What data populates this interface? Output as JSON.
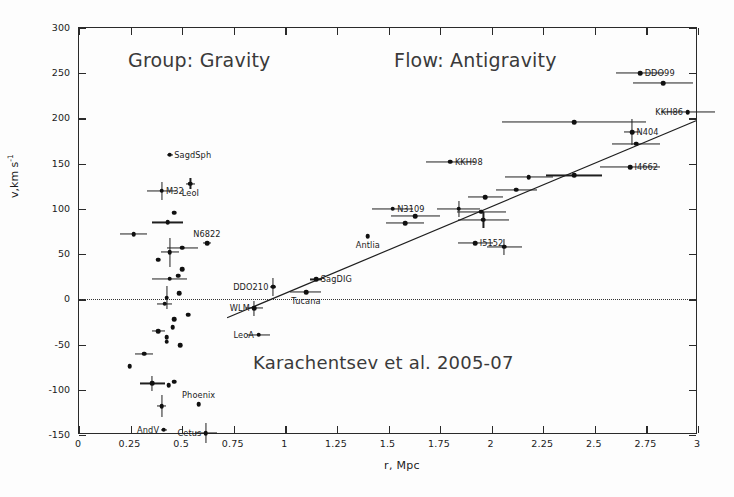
{
  "figure": {
    "background": "#fdfdfd",
    "ink_color": "#1b1b1b",
    "annotations": {
      "left_note": "Group: Gravity",
      "right_note": "Flow: Antigravity",
      "credit": "Karachentsev et al. 2005-07"
    }
  },
  "chart_data": {
    "type": "scatter",
    "title": "",
    "xlabel": "r, Mpc",
    "ylabel": "v,km s-1",
    "ylabel_parts": {
      "base": "v,km s",
      "exponent": "-1"
    },
    "xlim": [
      0,
      3
    ],
    "ylim": [
      -150,
      300
    ],
    "xticks": [
      0,
      0.25,
      0.5,
      0.75,
      1,
      1.25,
      1.5,
      1.75,
      2,
      2.25,
      2.5,
      2.75,
      3
    ],
    "xticklabels": [
      "0",
      "0.25",
      "0.5",
      "0.75",
      "1",
      "1.25",
      "1.5",
      "1.75",
      "2",
      "2.25",
      "2.5",
      "2.75",
      "3"
    ],
    "yticks": [
      -150,
      -100,
      -50,
      0,
      50,
      100,
      150,
      200,
      250,
      300
    ],
    "yticklabels": [
      "-150",
      "-100",
      "-50",
      "0",
      "50",
      "100",
      "150",
      "200",
      "250",
      "300"
    ],
    "grid": false,
    "legend": null,
    "zero_line": {
      "y": 0,
      "style": "dotted"
    },
    "fit_line": {
      "label": "",
      "x_start": 0.72,
      "y_start": -22,
      "x_end": 3.0,
      "y_end": 197
    },
    "points": [
      {
        "label": "SagdSph",
        "x": 0.44,
        "y": 160,
        "xerr": 0.015,
        "yerr": 0,
        "label_side": "right"
      },
      {
        "label": "M32",
        "x": 0.4,
        "y": 120,
        "xerr": 0.07,
        "yerr": 10,
        "label_side": "right"
      },
      {
        "label": "LeoI",
        "x": 0.54,
        "y": 128,
        "xerr": 0.02,
        "yerr": 6,
        "label_side": "below"
      },
      {
        "label": "",
        "x": 0.46,
        "y": 96,
        "xerr": 0,
        "yerr": 0,
        "label_side": "right"
      },
      {
        "label": "",
        "x": 0.43,
        "y": 85,
        "xerr": 0.075,
        "yerr": 0,
        "label_side": "right"
      },
      {
        "label": "",
        "x": 0.265,
        "y": 72,
        "xerr": 0.065,
        "yerr": 0,
        "label_side": "right"
      },
      {
        "label": "N6822",
        "x": 0.62,
        "y": 62,
        "xerr": 0.02,
        "yerr": 0,
        "label_side": "above"
      },
      {
        "label": "",
        "x": 0.44,
        "y": 52,
        "xerr": 0.045,
        "yerr": 16,
        "label_side": "right"
      },
      {
        "label": "",
        "x": 0.5,
        "y": 57,
        "xerr": 0.075,
        "yerr": 0,
        "label_side": "right"
      },
      {
        "label": "",
        "x": 0.385,
        "y": 44,
        "xerr": 0,
        "yerr": 0,
        "label_side": "right"
      },
      {
        "label": "",
        "x": 0.5,
        "y": 33,
        "xerr": 0,
        "yerr": 0,
        "label_side": "right"
      },
      {
        "label": "",
        "x": 0.48,
        "y": 26,
        "xerr": 0,
        "yerr": 0,
        "label_side": "right"
      },
      {
        "label": "",
        "x": 0.44,
        "y": 23,
        "xerr": 0.085,
        "yerr": 0,
        "label_side": "right"
      },
      {
        "label": "",
        "x": 0.485,
        "y": 7,
        "xerr": 0,
        "yerr": 0,
        "label_side": "right"
      },
      {
        "label": "",
        "x": 0.425,
        "y": 2,
        "xerr": 0,
        "yerr": 13,
        "label_side": "right"
      },
      {
        "label": "",
        "x": 0.415,
        "y": -5,
        "xerr": 0.035,
        "yerr": 0,
        "label_side": "right"
      },
      {
        "label": "",
        "x": 0.53,
        "y": -17,
        "xerr": 0,
        "yerr": 0,
        "label_side": "right"
      },
      {
        "label": "",
        "x": 0.46,
        "y": -22,
        "xerr": 0,
        "yerr": 0,
        "label_side": "right"
      },
      {
        "label": "",
        "x": 0.455,
        "y": -31,
        "xerr": 0,
        "yerr": 0,
        "label_side": "right"
      },
      {
        "label": "",
        "x": 0.385,
        "y": -35,
        "xerr": 0.03,
        "yerr": 0,
        "label_side": "right"
      },
      {
        "label": "",
        "x": 0.425,
        "y": -42,
        "xerr": 0,
        "yerr": 0,
        "label_side": "right"
      },
      {
        "label": "",
        "x": 0.425,
        "y": -47,
        "xerr": 0,
        "yerr": 0,
        "label_side": "right"
      },
      {
        "label": "",
        "x": 0.49,
        "y": -51,
        "xerr": 0,
        "yerr": 0,
        "label_side": "right"
      },
      {
        "label": "",
        "x": 0.315,
        "y": -60,
        "xerr": 0.045,
        "yerr": 0,
        "label_side": "right"
      },
      {
        "label": "",
        "x": 0.245,
        "y": -74,
        "xerr": 0,
        "yerr": 0,
        "label_side": "right"
      },
      {
        "label": "",
        "x": 0.355,
        "y": -93,
        "xerr": 0.06,
        "yerr": 8,
        "label_side": "right"
      },
      {
        "label": "",
        "x": 0.46,
        "y": -91,
        "xerr": 0,
        "yerr": 0,
        "label_side": "right"
      },
      {
        "label": "",
        "x": 0.435,
        "y": -95,
        "xerr": 0,
        "yerr": 0,
        "label_side": "right"
      },
      {
        "label": "Phoenix",
        "x": 0.58,
        "y": -116,
        "xerr": 0,
        "yerr": 0,
        "label_side": "above"
      },
      {
        "label": "",
        "x": 0.4,
        "y": -118,
        "xerr": 0.02,
        "yerr": 12,
        "label_side": "right"
      },
      {
        "label": "AndV",
        "x": 0.41,
        "y": -144,
        "xerr": 0.015,
        "yerr": 0,
        "label_side": "left"
      },
      {
        "label": "Cetus",
        "x": 0.615,
        "y": -148,
        "xerr": 0.055,
        "yerr": 11,
        "label_side": "left"
      },
      {
        "label": "DDO210",
        "x": 0.94,
        "y": 14,
        "xerr": 0.015,
        "yerr": 10,
        "label_side": "left"
      },
      {
        "label": "SagDIG",
        "x": 1.15,
        "y": 22,
        "xerr": 0.03,
        "yerr": 0,
        "label_side": "right"
      },
      {
        "label": "Tucana",
        "x": 1.1,
        "y": 8,
        "xerr": 0.075,
        "yerr": 0,
        "label_side": "below"
      },
      {
        "label": "WLM",
        "x": 0.85,
        "y": -10,
        "xerr": 0.04,
        "yerr": 8,
        "label_side": "left"
      },
      {
        "label": "LeoA",
        "x": 0.87,
        "y": -39,
        "xerr": 0.055,
        "yerr": 0,
        "label_side": "left"
      },
      {
        "label": "Antlia",
        "x": 1.4,
        "y": 70,
        "xerr": 0,
        "yerr": 0,
        "label_side": "below"
      },
      {
        "label": "N3109",
        "x": 1.52,
        "y": 100,
        "xerr": 0.1,
        "yerr": 0,
        "label_side": "right"
      },
      {
        "label": "",
        "x": 1.63,
        "y": 92,
        "xerr": 0.12,
        "yerr": 0,
        "label_side": "right"
      },
      {
        "label": "",
        "x": 1.58,
        "y": 84,
        "xerr": 0.09,
        "yerr": 0,
        "label_side": "right"
      },
      {
        "label": "KKH98",
        "x": 1.8,
        "y": 152,
        "xerr": 0.12,
        "yerr": 0,
        "label_side": "right"
      },
      {
        "label": "",
        "x": 1.84,
        "y": 100,
        "xerr": 0.105,
        "yerr": 9,
        "label_side": "right"
      },
      {
        "label": "",
        "x": 1.95,
        "y": 97,
        "xerr": 0.12,
        "yerr": 0,
        "label_side": "right"
      },
      {
        "label": "",
        "x": 1.96,
        "y": 88,
        "xerr": 0.125,
        "yerr": 9,
        "label_side": "right"
      },
      {
        "label": "I5152",
        "x": 1.92,
        "y": 62,
        "xerr": 0.085,
        "yerr": 0,
        "label_side": "right"
      },
      {
        "label": "",
        "x": 2.06,
        "y": 58,
        "xerr": 0.085,
        "yerr": 9,
        "label_side": "right"
      },
      {
        "label": "",
        "x": 1.97,
        "y": 113,
        "xerr": 0.085,
        "yerr": 0,
        "label_side": "right"
      },
      {
        "label": "",
        "x": 2.12,
        "y": 121,
        "xerr": 0.1,
        "yerr": 0,
        "label_side": "right"
      },
      {
        "label": "",
        "x": 2.18,
        "y": 135,
        "xerr": 0.115,
        "yerr": 0,
        "label_side": "right"
      },
      {
        "label": "",
        "x": 2.4,
        "y": 137,
        "xerr": 0.135,
        "yerr": 0,
        "label_side": "right"
      },
      {
        "label": "I4662",
        "x": 2.67,
        "y": 146,
        "xerr": 0.145,
        "yerr": 0,
        "label_side": "right"
      },
      {
        "label": "N404",
        "x": 2.68,
        "y": 185,
        "xerr": 0.04,
        "yerr": 14,
        "label_side": "right"
      },
      {
        "label": "",
        "x": 2.7,
        "y": 172,
        "xerr": 0.115,
        "yerr": 0,
        "label_side": "right"
      },
      {
        "label": "",
        "x": 2.4,
        "y": 196,
        "xerr": 0.35,
        "yerr": 0,
        "label_side": "right"
      },
      {
        "label": "KKH86",
        "x": 2.95,
        "y": 207,
        "xerr": 0.13,
        "yerr": 0,
        "label_side": "left"
      },
      {
        "label": "DDO99",
        "x": 2.72,
        "y": 250,
        "xerr": 0.115,
        "yerr": 0,
        "label_side": "right"
      },
      {
        "label": "",
        "x": 2.83,
        "y": 239,
        "xerr": 0.145,
        "yerr": 0,
        "label_side": "right"
      }
    ]
  }
}
